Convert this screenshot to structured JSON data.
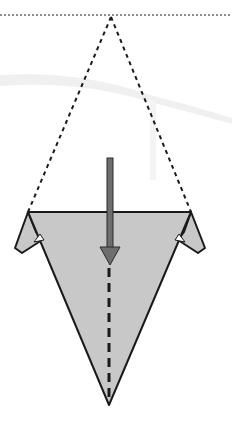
{
  "diagram": {
    "type": "origami-fold-step",
    "description": "Origami step: valley fold the shape in half along the vertical center line; dotted triangle shows previous position",
    "colors": {
      "background": "#ffffff",
      "paper_fill": "#c8c8c8",
      "outline": "#1a1a1a",
      "arrow_fill": "#6e6e6e",
      "arrow_stroke": "#2a2a2a",
      "guide_dashes": "#1a1a1a",
      "smudge": "#eeeeee"
    },
    "elements": {
      "top_reference_line": {
        "style": "dotted",
        "y": 15
      },
      "previous_position_outline": {
        "style": "dashed",
        "apex": [
          111,
          17
        ],
        "base_left": [
          28,
          212
        ],
        "base_right": [
          191,
          212
        ]
      },
      "paper_shape": {
        "top_left": [
          28,
          212
        ],
        "top_right": [
          191,
          212
        ],
        "bottom_point": [
          109,
          405
        ]
      },
      "left_flap": {
        "points": [
          [
            28,
            212
          ],
          [
            15,
            248
          ],
          [
            22,
            252
          ],
          [
            38,
            238
          ]
        ]
      },
      "right_flap": {
        "points": [
          [
            191,
            212
          ],
          [
            205,
            248
          ],
          [
            198,
            252
          ],
          [
            182,
            238
          ]
        ]
      },
      "fold_arrow": {
        "direction": "down",
        "x": 110,
        "tail_y": 158,
        "head_y": 265
      },
      "valley_fold_line": {
        "style": "dashed",
        "x": 109,
        "from_y": 268,
        "to_y": 400
      }
    }
  }
}
